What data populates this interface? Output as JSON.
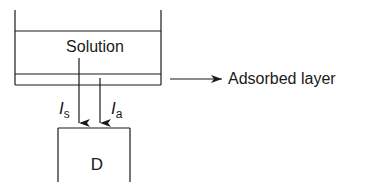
{
  "diagram": {
    "container": {
      "solution_label": "Solution"
    },
    "adsorbed_layer": {
      "label": "Adsorbed layer"
    },
    "beams": [
      {
        "symbol": "I",
        "subscript": "s",
        "source": "solution"
      },
      {
        "symbol": "I",
        "subscript": "a",
        "source": "adsorbed layer"
      }
    ],
    "detector": {
      "label": "D"
    },
    "colors": {
      "line": "#1a1a1a",
      "background": "#ffffff"
    }
  }
}
